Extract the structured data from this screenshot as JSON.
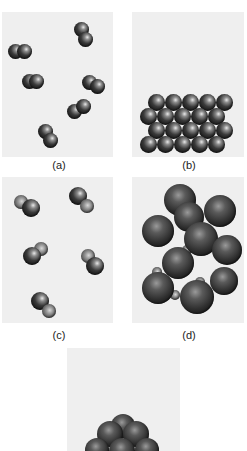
{
  "figure": {
    "panels": [
      {
        "id": "a",
        "label": "(a)",
        "description": "gas of diatomic molecules (same element)"
      },
      {
        "id": "b",
        "label": "(b)",
        "description": "solid lattice of identical atoms"
      },
      {
        "id": "c",
        "label": "(c)",
        "description": "gas of diatomic molecules (two different elements)"
      },
      {
        "id": "d",
        "label": "(d)",
        "description": "solid cluster of large and small atoms"
      },
      {
        "id": "e",
        "label": "",
        "description": "stacked atom pyramid (partially visible)"
      }
    ]
  },
  "colors": {
    "panel_bg": "#efefef",
    "page_bg": "#ffffff",
    "atom_dark": "#1a1a1a",
    "atom_highlight": "#e8e8e8"
  }
}
